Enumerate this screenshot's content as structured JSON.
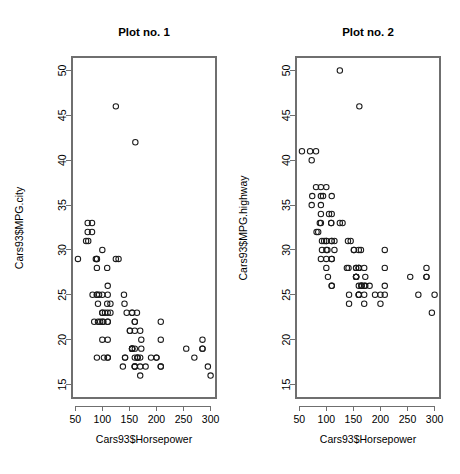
{
  "figure": {
    "width": 460,
    "height": 474,
    "background": "#ffffff",
    "point_color": "#1a1a1a",
    "axis_color": "#6f6f6f"
  },
  "panels": [
    {
      "id": "plot-1",
      "title": "Plot no. 1"
    },
    {
      "id": "plot-2",
      "title": "Plot no. 2"
    }
  ],
  "chart_data": [
    {
      "type": "scatter",
      "title": "Plot no. 1",
      "xlabel": "Cars93$Horsepower",
      "ylabel": "Cars93$MPG.city",
      "xlim": [
        44,
        310
      ],
      "ylim": [
        13.5,
        51.5
      ],
      "xticks": [
        50,
        100,
        150,
        200,
        250,
        300
      ],
      "yticks": [
        15,
        20,
        25,
        30,
        35,
        40,
        45,
        50
      ],
      "grid": false,
      "legend": null,
      "marker": "open-circle",
      "x": [
        140,
        200,
        172,
        172,
        208,
        110,
        160,
        300,
        255,
        170,
        180,
        170,
        200,
        295,
        170,
        285,
        90,
        115,
        102,
        145,
        130,
        115,
        160,
        110,
        110,
        110,
        110,
        160,
        165,
        208,
        155,
        155,
        142,
        285,
        88,
        74,
        100,
        55,
        90,
        92,
        103,
        125,
        100,
        92,
        161,
        141,
        151,
        70,
        138,
        90,
        81,
        100,
        90,
        164,
        270,
        208,
        155,
        109,
        190,
        110,
        160,
        165,
        208,
        155,
        155,
        142,
        285,
        151,
        73,
        100,
        85,
        90,
        105,
        100,
        110,
        160,
        110,
        160,
        100,
        165,
        155,
        160,
        125,
        81,
        90,
        73,
        82,
        94,
        96,
        109,
        160,
        170,
        155
      ],
      "y": [
        25,
        18,
        20,
        19,
        22,
        22,
        19,
        16,
        19,
        16,
        17,
        17,
        18,
        17,
        21,
        20,
        29,
        23,
        22,
        23,
        29,
        24,
        22,
        26,
        20,
        18,
        18,
        17,
        18,
        17,
        19,
        23,
        18,
        19,
        29,
        31,
        23,
        29,
        18,
        22,
        18,
        46,
        30,
        24,
        42,
        24,
        21,
        31,
        17,
        28,
        33,
        20,
        25,
        23,
        18,
        20,
        19,
        28,
        18,
        22,
        17,
        18,
        17,
        19,
        23,
        18,
        19,
        21,
        32,
        25,
        22,
        25,
        23,
        22,
        25,
        17,
        23,
        22,
        23,
        18,
        19,
        18,
        29,
        32,
        29,
        33,
        25,
        25,
        22,
        24,
        21,
        18,
        19
      ]
    },
    {
      "type": "scatter",
      "title": "Plot no. 2",
      "xlabel": "Cars93$Horsepower",
      "ylabel": "Cars93$MPG.highway",
      "xlim": [
        44,
        310
      ],
      "ylim": [
        13.5,
        51.5
      ],
      "xticks": [
        50,
        100,
        150,
        200,
        250,
        300
      ],
      "yticks": [
        15,
        20,
        25,
        30,
        35,
        40,
        45,
        50
      ],
      "grid": false,
      "legend": null,
      "marker": "open-circle",
      "x": [
        140,
        200,
        172,
        172,
        208,
        110,
        160,
        300,
        255,
        170,
        180,
        170,
        200,
        295,
        170,
        285,
        90,
        115,
        102,
        145,
        130,
        115,
        160,
        110,
        110,
        110,
        110,
        160,
        165,
        208,
        155,
        155,
        142,
        285,
        88,
        74,
        100,
        55,
        90,
        92,
        103,
        125,
        100,
        92,
        161,
        141,
        151,
        70,
        138,
        90,
        81,
        100,
        90,
        164,
        270,
        208,
        155,
        109,
        190,
        110,
        160,
        165,
        208,
        155,
        155,
        142,
        285,
        151,
        73,
        100,
        85,
        90,
        105,
        100,
        110,
        160,
        110,
        160,
        100,
        165,
        155,
        160,
        125,
        81,
        90,
        73,
        82,
        94,
        96,
        109,
        160,
        170,
        155
      ],
      "y": [
        31,
        25,
        26,
        27,
        30,
        31,
        28,
        25,
        27,
        25,
        26,
        26,
        24,
        23,
        28,
        28,
        33,
        31,
        30,
        31,
        33,
        30,
        28,
        34,
        29,
        26,
        26,
        25,
        26,
        26,
        27,
        28,
        24,
        27,
        33,
        36,
        31,
        41,
        29,
        31,
        27,
        50,
        37,
        30,
        46,
        28,
        30,
        41,
        28,
        34,
        41,
        28,
        36,
        30,
        25,
        28,
        27,
        33,
        25,
        29,
        25,
        26,
        25,
        27,
        28,
        25,
        27,
        30,
        40,
        31,
        32,
        37,
        34,
        29,
        36,
        25,
        31,
        30,
        30,
        26,
        27,
        26,
        33,
        37,
        35,
        35,
        32,
        36,
        31,
        33,
        28,
        24,
        27
      ]
    }
  ]
}
